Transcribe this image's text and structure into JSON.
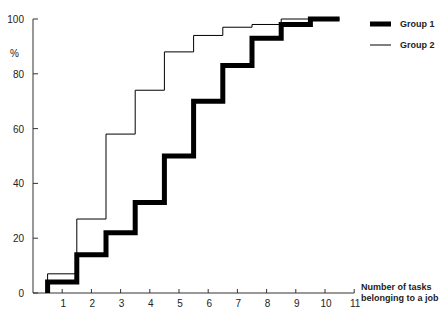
{
  "chart_data": {
    "type": "line",
    "step": true,
    "title": "",
    "xlabel": "Number of tasks belonging to a job",
    "xlabel_lines": [
      "Number of tasks",
      "belonging to a job"
    ],
    "ylabel": "%",
    "x": [
      1,
      2,
      3,
      4,
      5,
      6,
      7,
      8,
      9,
      10
    ],
    "xticks": [
      1,
      2,
      3,
      4,
      5,
      6,
      7,
      8,
      9,
      10,
      11
    ],
    "yticks": [
      0,
      20,
      40,
      60,
      80,
      100
    ],
    "xlim": [
      0,
      11
    ],
    "ylim": [
      0,
      100
    ],
    "grid": false,
    "legend_position": "top-right",
    "series": [
      {
        "name": "Group 1",
        "style": "thick",
        "color": "#000000",
        "values": [
          4,
          14,
          22,
          33,
          50,
          70,
          83,
          93,
          98,
          100
        ]
      },
      {
        "name": "Group 2",
        "style": "thin",
        "color": "#000000",
        "values": [
          7,
          27,
          58,
          74,
          88,
          94,
          97,
          98,
          100,
          100
        ]
      }
    ]
  }
}
